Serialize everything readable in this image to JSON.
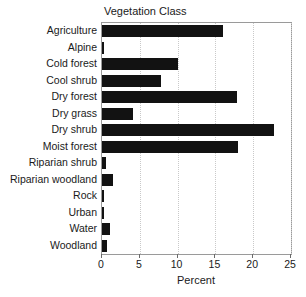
{
  "chart_data": {
    "type": "bar",
    "orientation": "horizontal",
    "title": "Vegetation Class",
    "xlabel": "Percent",
    "ylabel": "",
    "xlim": [
      0,
      25
    ],
    "xticks": [
      0,
      5,
      10,
      15,
      20,
      25
    ],
    "grid": "vertical-dotted",
    "legend": "none",
    "bar_color": "#121212",
    "grid_color": "#c9c9c9",
    "frame_color": "#9a9a9a",
    "categories": [
      "Agriculture",
      "Alpine",
      "Cold forest",
      "Cool shrub",
      "Dry forest",
      "Dry grass",
      "Dry shrub",
      "Moist forest",
      "Riparian shrub",
      "Riparian woodland",
      "Rock",
      "Urban",
      "Water",
      "Woodland"
    ],
    "values": [
      16.0,
      0.3,
      10.0,
      7.8,
      17.8,
      4.1,
      22.8,
      18.0,
      0.5,
      1.5,
      0.2,
      0.2,
      1.0,
      0.6
    ]
  }
}
